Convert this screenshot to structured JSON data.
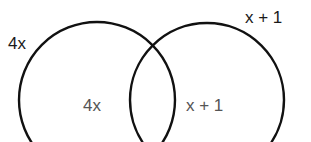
{
  "diagram": {
    "type": "venn",
    "stroke_color": "#111111",
    "circles": [
      {
        "name": "left",
        "outer_label": "4x",
        "region_label": "4x"
      },
      {
        "name": "right",
        "outer_label": "x + 1",
        "region_label": "x + 1"
      }
    ]
  }
}
